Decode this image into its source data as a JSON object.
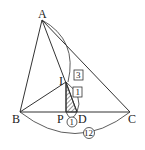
{
  "diagram": {
    "points": {
      "A": {
        "label": "A"
      },
      "B": {
        "label": "B"
      },
      "C": {
        "label": "C"
      },
      "I": {
        "label": "I"
      },
      "P": {
        "label": "P"
      },
      "D": {
        "label": "D"
      }
    },
    "ratios": {
      "AI": "3",
      "ID": "1"
    },
    "lengths": {
      "PD": "1",
      "BC": "12"
    },
    "colors": {
      "stroke": "#333333",
      "hatch": "#333333"
    }
  }
}
